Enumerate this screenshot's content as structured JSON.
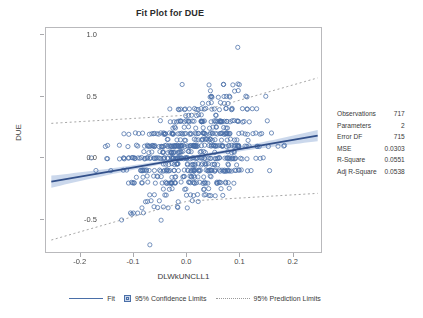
{
  "title": "Fit Plot for DUE",
  "axes": {
    "xlabel": "DLWkUNCLL1",
    "ylabel": "DUE",
    "xticks": [
      "-0.2",
      "-0.1",
      "0.0",
      "0.1",
      "0.2"
    ],
    "xtick_values": [
      -0.2,
      -0.1,
      0.0,
      0.1,
      0.2
    ],
    "yticks": [
      "1.0",
      "0.5",
      "0.0",
      "-0.5"
    ],
    "ytick_values": [
      1.0,
      0.5,
      0.0,
      -0.5
    ],
    "xlim": [
      -0.265,
      0.255
    ],
    "ylim": [
      -0.78,
      1.06
    ]
  },
  "stats": {
    "rows": [
      {
        "label": "Observations",
        "value": "717"
      },
      {
        "label": "Parameters",
        "value": "2"
      },
      {
        "label": "Error DF",
        "value": "715"
      },
      {
        "label": "MSE",
        "value": "0.0303"
      },
      {
        "label": "R-Square",
        "value": "0.0551"
      },
      {
        "label": "Adj R-Square",
        "value": "0.0538"
      }
    ]
  },
  "legend": {
    "fit": "Fit",
    "confidence": "95% Confidence Limits",
    "prediction": "95% Prediction Limits"
  },
  "colors": {
    "marker": "#4a6fa8",
    "fit_line": "#32508a",
    "band_fill": "#b9cbe6",
    "prediction_line": "#9a9a9a",
    "frame": "#b9b9bc",
    "text": "#3a3a3a"
  },
  "chart_data": {
    "type": "scatter",
    "title": "Fit Plot for DUE",
    "xlabel": "DLWkUNCLL1",
    "ylabel": "DUE",
    "xlim": [
      -0.265,
      0.255
    ],
    "ylim": [
      -0.78,
      1.06
    ],
    "grid": false,
    "legend_position": "bottom",
    "n_observations": 717,
    "fit": {
      "type": "linear",
      "intercept": 0.0,
      "slope": 0.75,
      "x_start": -0.255,
      "x_end": 0.245,
      "y_start": -0.191,
      "y_end": 0.184
    },
    "confidence_band": {
      "level": 0.95,
      "half_width_at_center": 0.013,
      "half_width_at_edges": 0.048
    },
    "prediction_band": {
      "level": 0.95,
      "half_width": 0.35
    },
    "y_bands": [
      -0.7,
      -0.5,
      -0.45,
      -0.4,
      -0.35,
      -0.3,
      -0.25,
      -0.2,
      -0.15,
      -0.1,
      -0.05,
      0.0,
      0.05,
      0.1,
      0.15,
      0.2,
      0.25,
      0.3,
      0.35,
      0.4,
      0.45,
      0.5,
      0.55,
      0.6,
      0.9
    ],
    "band_counts": [
      1,
      2,
      5,
      8,
      7,
      14,
      10,
      46,
      22,
      72,
      30,
      96,
      34,
      104,
      26,
      70,
      14,
      48,
      8,
      26,
      6,
      12,
      3,
      7,
      1
    ],
    "band_x_spread": [
      0.02,
      0.09,
      0.1,
      0.1,
      0.1,
      0.12,
      0.11,
      0.16,
      0.13,
      0.19,
      0.14,
      0.22,
      0.15,
      0.21,
      0.14,
      0.18,
      0.12,
      0.16,
      0.11,
      0.15,
      0.1,
      0.13,
      0.09,
      0.14,
      0.01
    ],
    "band_x_center": [
      -0.065,
      -0.085,
      -0.06,
      -0.03,
      -0.02,
      -0.005,
      0.0,
      -0.01,
      0.0,
      0.0,
      0.01,
      0.0,
      0.01,
      0.005,
      0.015,
      0.02,
      0.03,
      0.04,
      0.04,
      0.045,
      0.05,
      0.06,
      0.06,
      0.08,
      0.1
    ]
  }
}
